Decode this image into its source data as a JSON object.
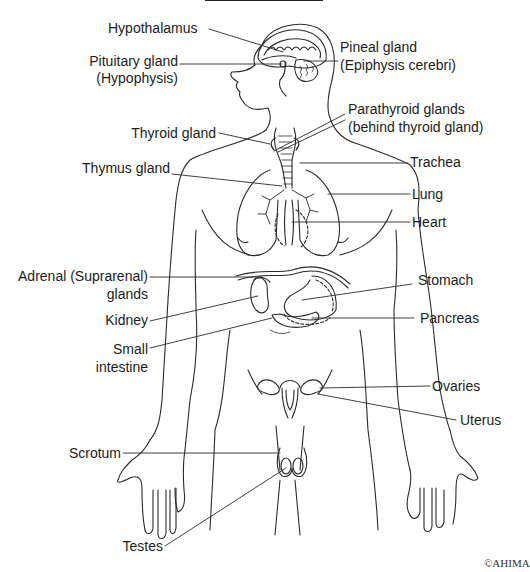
{
  "diagram": {
    "labels": {
      "hypothalamus": "Hypothalamus",
      "pituitary": "Pituitary gland",
      "pituitary_alt": "(Hypophysis)",
      "pineal": "Pineal gland",
      "pineal_alt": "(Epiphysis cerebri)",
      "parathyroid": "Parathyroid glands",
      "parathyroid_note": "(behind thyroid gland)",
      "thyroid": "Thyroid gland",
      "thymus": "Thymus gland",
      "trachea": "Trachea",
      "lung": "Lung",
      "heart": "Heart",
      "adrenal": "Adrenal (Suprarenal)",
      "adrenal_2": "glands",
      "stomach": "Stomach",
      "kidney": "Kidney",
      "pancreas": "Pancreas",
      "small_intestine": "Small",
      "small_intestine_2": "intestine",
      "ovaries": "Ovaries",
      "uterus": "Uterus",
      "scrotum": "Scrotum",
      "testes": "Testes"
    },
    "copyright": "©AHIMA",
    "colors": {
      "line": "#2a2a2a",
      "text": "#1c1c1c",
      "background": "#ffffff"
    }
  }
}
